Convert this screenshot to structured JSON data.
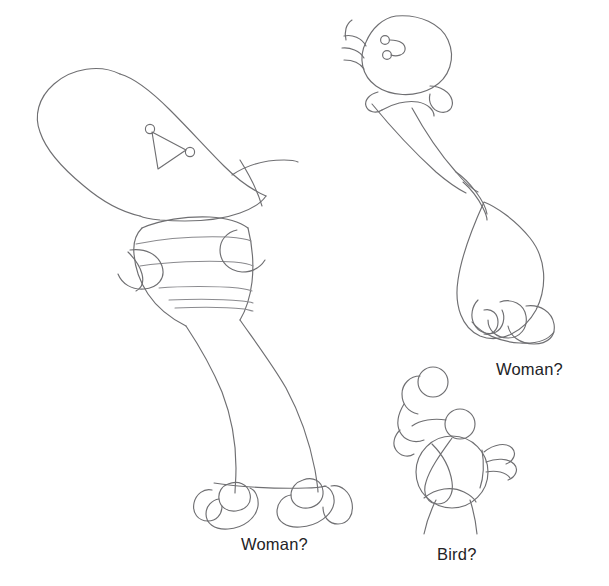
{
  "page": {
    "background_color": "#ffffff",
    "ink_color": "#6f6f72",
    "caption_color": "#232326",
    "width": 609,
    "height": 586
  },
  "figures": [
    {
      "id": "figure-woman-left",
      "caption": "Woman?",
      "caption_position": {
        "x": 241,
        "y": 535
      },
      "description": "Large contour sketch of a standing woman: head and shoulder mass upper left, triangular face with two small circle features, striped mid-section, long flared skirt, two looping shoes at the bottom."
    },
    {
      "id": "figure-woman-right",
      "caption": "Woman?",
      "caption_position": {
        "x": 496,
        "y": 360
      },
      "description": "Contour sketch of a figure with a rounded head at the top bearing two small circle eyes and hair strokes, a long tapering neck, a teardrop shaped body and looping feet."
    },
    {
      "id": "figure-bird",
      "caption": "Bird?",
      "caption_position": {
        "x": 437,
        "y": 545
      },
      "description": "Small contour sketch of a bird: round body, small circular head, a second loose circle above, feather strokes at the right for the tail and two thin legs beneath."
    }
  ],
  "captions": {
    "woman_left": "Woman?",
    "woman_right": "Woman?",
    "bird": "Bird?"
  }
}
